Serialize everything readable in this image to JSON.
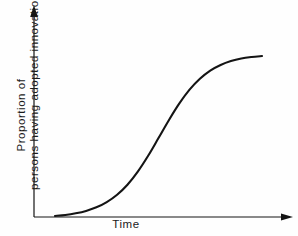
{
  "chart_data": {
    "type": "line",
    "title": "",
    "subtitle": "",
    "xlabel": "Time",
    "ylabel_line_1": "Proportion of",
    "ylabel_line_2": "persons having adopted innovation",
    "ylabel": "Proportion of persons having adopted innovation",
    "grid": false,
    "legend": null,
    "legend_position": "none",
    "xlim": [
      0,
      1
    ],
    "ylim": [
      0,
      1
    ],
    "x_tick_labels": [],
    "y_tick_labels": [],
    "axis_style": "arrow-ended",
    "annotations": [],
    "series": [
      {
        "name": "Cumulative adoption (S-curve)",
        "x": [
          0.0,
          0.05,
          0.1,
          0.15,
          0.2,
          0.25,
          0.3,
          0.35,
          0.4,
          0.45,
          0.5,
          0.55,
          0.6,
          0.65,
          0.7,
          0.75,
          0.8,
          0.85,
          0.9,
          0.95,
          1.0
        ],
        "values": [
          0.01,
          0.016,
          0.026,
          0.04,
          0.061,
          0.092,
          0.135,
          0.194,
          0.271,
          0.364,
          0.468,
          0.573,
          0.67,
          0.752,
          0.816,
          0.864,
          0.897,
          0.92,
          0.935,
          0.944,
          0.95
        ]
      }
    ],
    "colors": {
      "curve": "#141414",
      "axis": "#141414",
      "background": "#fefefe",
      "text": "#1b1b1b"
    }
  }
}
